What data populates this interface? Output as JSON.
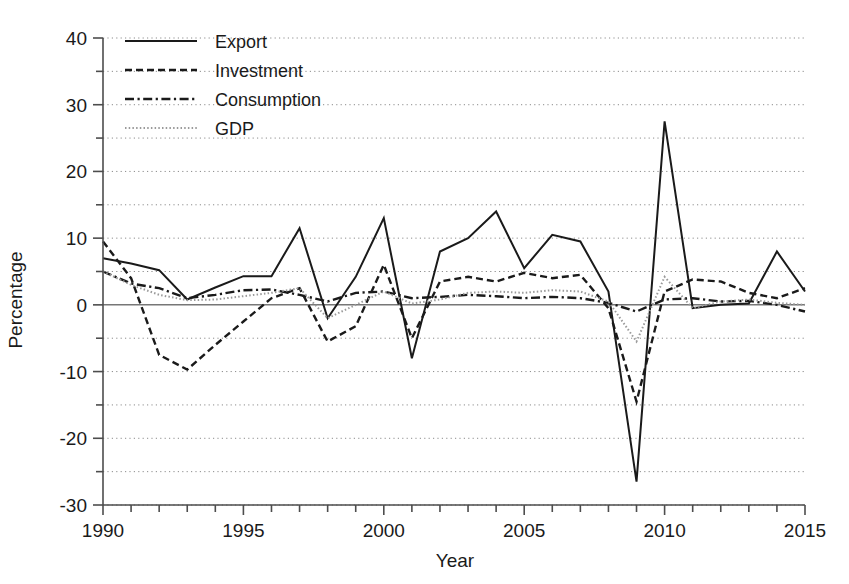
{
  "chart_data": {
    "type": "line",
    "title": "",
    "xlabel": "Year",
    "ylabel": "Percentage",
    "xlim": [
      1990,
      2015
    ],
    "ylim": [
      -30,
      40
    ],
    "x_major_ticks": [
      1990,
      1995,
      2000,
      2005,
      2010,
      2015
    ],
    "x_tick_labels": [
      "1990",
      "1995",
      "2000",
      "2005",
      "2010",
      "2015"
    ],
    "x_minor_step": 1,
    "y_major_ticks": [
      -30,
      -20,
      -10,
      0,
      10,
      20,
      30,
      40
    ],
    "y_tick_labels": [
      "-30",
      "-20",
      "-10",
      "0",
      "10",
      "20",
      "30",
      "40"
    ],
    "y_minor_ticks": [
      -25,
      -15,
      -5,
      5,
      15,
      25,
      35
    ],
    "grid": true,
    "grid_axis": "y",
    "legend_position": "top-left",
    "x": [
      1990,
      1991,
      1992,
      1993,
      1994,
      1995,
      1996,
      1997,
      1998,
      1999,
      2000,
      2001,
      2002,
      2003,
      2004,
      2005,
      2006,
      2007,
      2008,
      2009,
      2010,
      2011,
      2012,
      2013,
      2014,
      2015
    ],
    "series": [
      {
        "name": "Export",
        "style": "solid",
        "color": "#1a1a1a",
        "values": [
          7.0,
          6.2,
          5.2,
          0.8,
          2.6,
          4.3,
          4.3,
          11.5,
          -2.0,
          4.2,
          13.0,
          -8.0,
          8.0,
          10.0,
          14.0,
          5.5,
          10.5,
          9.5,
          2.0,
          -26.5,
          27.5,
          -0.5,
          0.0,
          0.2,
          8.0,
          2.0
        ]
      },
      {
        "name": "Investment",
        "style": "dashed",
        "color": "#1a1a1a",
        "values": [
          9.5,
          4.0,
          -7.5,
          -9.7,
          -6.0,
          -2.5,
          1.0,
          2.5,
          -5.5,
          -3.2,
          6.0,
          -5.0,
          3.5,
          4.2,
          3.5,
          4.8,
          4.0,
          4.5,
          -0.5,
          -14.5,
          2.0,
          3.8,
          3.5,
          1.8,
          1.0,
          2.5
        ]
      },
      {
        "name": "Consumption",
        "style": "dashdot",
        "color": "#1a1a1a",
        "values": [
          5.0,
          3.2,
          2.5,
          1.0,
          1.5,
          2.2,
          2.3,
          1.5,
          0.5,
          1.8,
          2.0,
          1.0,
          1.2,
          1.5,
          1.3,
          1.0,
          1.2,
          1.0,
          0.3,
          -1.0,
          0.8,
          1.0,
          0.5,
          0.6,
          0.0,
          -1.0
        ]
      },
      {
        "name": "GDP",
        "style": "dotted",
        "color": "#9a9a9a",
        "values": [
          5.0,
          3.0,
          1.5,
          0.7,
          0.8,
          1.3,
          1.8,
          2.5,
          -2.0,
          0.0,
          2.0,
          0.2,
          0.8,
          1.8,
          2.0,
          1.8,
          2.2,
          2.0,
          0.5,
          -5.5,
          4.2,
          -0.5,
          0.5,
          0.8,
          0.3,
          0.0
        ]
      }
    ]
  },
  "legend": {
    "items": [
      {
        "label": "Export"
      },
      {
        "label": "Investment"
      },
      {
        "label": "Consumption"
      },
      {
        "label": "GDP"
      }
    ]
  }
}
